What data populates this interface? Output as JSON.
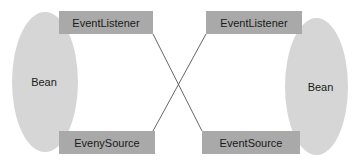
{
  "diagram": {
    "left_bean": {
      "label": "Bean",
      "listener_label": "EventListener",
      "source_label": "EvenySource"
    },
    "right_bean": {
      "label": "Bean",
      "listener_label": "EventListener",
      "source_label": "EventSource"
    },
    "connections": [
      {
        "from": "left.EventListener",
        "to": "right.EventSource"
      },
      {
        "from": "left.EvenySource",
        "to": "right.EventListener"
      }
    ],
    "colors": {
      "ellipse_fill": "#d6d6d6",
      "box_fill": "#a9a9a9",
      "line": "#555555",
      "text": "#1a1a1a"
    }
  }
}
